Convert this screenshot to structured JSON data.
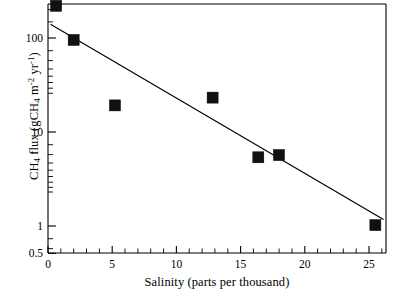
{
  "chart_data": {
    "type": "scatter",
    "title": "",
    "xlabel": "Salinity (parts per thousand)",
    "ylabel": "CH4 flux (gCH4 m-2 yr-1)",
    "ylabel_parts": {
      "lead": "CH",
      "sub1": "4",
      "mid": " flux (gCH",
      "sub2": "4",
      "mid2": " m",
      "sup1": "-2",
      "mid3": " yr",
      "sup2": "-1",
      "tail": ")"
    },
    "xscale": "linear",
    "yscale": "log",
    "xlim": [
      -0.2,
      26.8
    ],
    "ylim": [
      0.5,
      230
    ],
    "grid": false,
    "legend": null,
    "xticks": [
      0,
      5,
      10,
      15,
      20,
      25
    ],
    "xtick_labels": [
      "0",
      "5",
      "10",
      "15",
      "20",
      "25"
    ],
    "x_minor_step": 1,
    "yticks": [
      0.5,
      1,
      10,
      100
    ],
    "ytick_labels": [
      "0.5",
      "1",
      "10",
      "100"
    ],
    "points": [
      {
        "x": 0.45,
        "y": 220
      },
      {
        "x": 1.85,
        "y": 95
      },
      {
        "x": 5.15,
        "y": 19
      },
      {
        "x": 12.95,
        "y": 23
      },
      {
        "x": 16.6,
        "y": 5.3
      },
      {
        "x": 18.25,
        "y": 5.6
      },
      {
        "x": 25.95,
        "y": 1.0
      }
    ],
    "marker": {
      "shape": "square",
      "size_px": 11,
      "color": "#111111"
    },
    "fit_line": {
      "label": "log-linear regression",
      "x_start": 0,
      "y_start": 140,
      "x_end": 26.6,
      "y_end": 1.15,
      "color": "#000000"
    }
  }
}
